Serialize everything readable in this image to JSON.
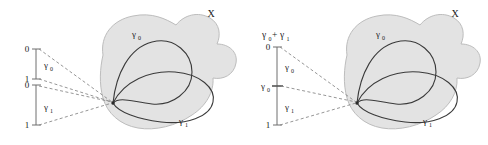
{
  "figure": {
    "type": "diagram",
    "background_color": "#ffffff",
    "blob_fill_color": "#e3e3e3",
    "blob_stroke_color": "#bdbdbd",
    "curve_color": "#3a3a3a",
    "dashed_color": "#8a8a8a",
    "axis_color": "#6e6e6e",
    "text_color": "#1a1a1a"
  },
  "panels": [
    {
      "id": "left",
      "name": "two-separate-intervals",
      "space_label": "X",
      "intervals": [
        {
          "name": "gamma0-interval",
          "start_label": "0",
          "end_label": "1",
          "bracket_label": "γ",
          "bracket_sub": "0"
        },
        {
          "name": "gamma1-interval",
          "start_label": "0",
          "end_label": "1",
          "bracket_label": "γ",
          "bracket_sub": "1"
        }
      ],
      "loops": [
        {
          "name": "upper-loop",
          "label": "γ",
          "sub": "0"
        },
        {
          "name": "lower-loop",
          "label": "γ",
          "sub": "1"
        }
      ],
      "dashed_rays": 4
    },
    {
      "id": "right",
      "name": "concatenated-interval",
      "space_label": "X",
      "top_label": "γ",
      "top_label_sub": "0",
      "top_label_plus": "+",
      "top_label_2": "γ",
      "top_label_2_sub": "1",
      "interval": {
        "name": "unit-interval",
        "start_label": "0",
        "end_label": "1",
        "mid_tick_label": "γ",
        "mid_tick_sub": "0",
        "upper_segment_label": "γ",
        "upper_segment_sub": "0",
        "lower_segment_label": "γ",
        "lower_segment_sub": "1"
      },
      "loops": [
        {
          "name": "upper-loop",
          "label": "γ",
          "sub": "0"
        },
        {
          "name": "lower-loop",
          "label": "γ",
          "sub": "1"
        }
      ],
      "dashed_rays": 3
    }
  ]
}
